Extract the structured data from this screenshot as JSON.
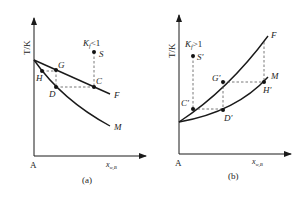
{
  "panels": [
    {
      "id": "a",
      "caption": "(a)",
      "y_axis_label": "T/K",
      "x_axis_label": "x",
      "x_axis_sub": "w,B",
      "origin_label": "A",
      "condition": {
        "main": "K",
        "sub": "f",
        "rest": "<1"
      },
      "points": {
        "S": "S",
        "C": "C",
        "G": "G",
        "H": "H",
        "D": "D"
      },
      "curves": {
        "upper": "F",
        "lower": "M"
      }
    },
    {
      "id": "b",
      "caption": "(b)",
      "y_axis_label": "T/K",
      "x_axis_label": "x",
      "x_axis_sub": "w,B",
      "origin_label": "A",
      "condition": {
        "main": "K",
        "sub": "f",
        "rest": ">1"
      },
      "points": {
        "S": "S′",
        "C": "C′",
        "G": "G′",
        "H": "H′",
        "D": "D′"
      },
      "curves": {
        "upper": "F",
        "lower": "M"
      }
    }
  ],
  "colors": {
    "line": "#1a1a1a",
    "dashed": "#555555"
  }
}
